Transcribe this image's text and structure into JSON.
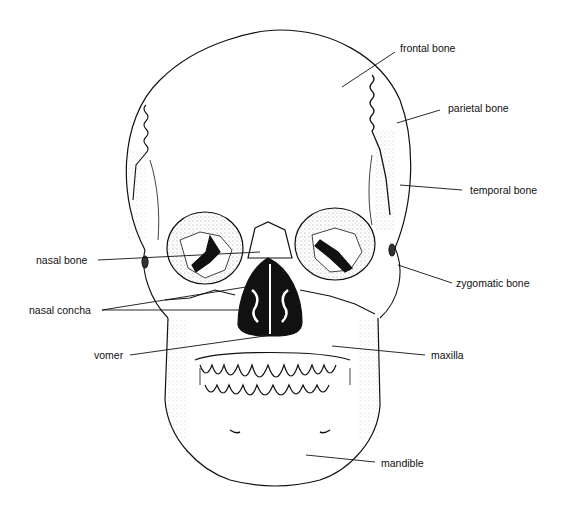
{
  "diagram": {
    "labels": {
      "frontal_bone": "frontal bone",
      "parietal_bone": "parietal bone",
      "temporal_bone": "temporal bone",
      "nasal_bone": "nasal bone",
      "zygomatic_bone": "zygomatic bone",
      "nasal_concha": "nasal concha",
      "vomer": "vomer",
      "maxilla": "maxilla",
      "mandible": "mandible"
    },
    "colors": {
      "line": "#111111",
      "background": "#ffffff"
    }
  }
}
